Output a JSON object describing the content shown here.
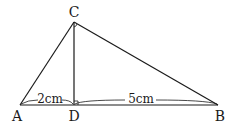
{
  "diagram": {
    "points": {
      "A": {
        "label": "A",
        "x": 20,
        "y": 105
      },
      "B": {
        "label": "B",
        "x": 218,
        "y": 105
      },
      "C": {
        "label": "C",
        "x": 74,
        "y": 22
      },
      "D": {
        "label": "D",
        "x": 74,
        "y": 105
      }
    },
    "measurements": {
      "AD": "2cm",
      "DB": "5cm"
    },
    "line_color": "#1a1a1a"
  }
}
